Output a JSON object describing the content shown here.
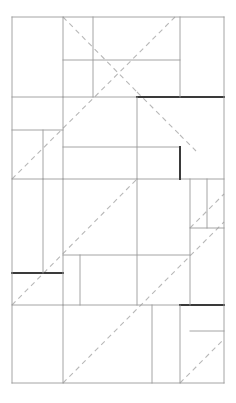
{
  "figure": {
    "canvas": {
      "width": 236,
      "height": 403,
      "background": "#ffffff"
    },
    "colors": {
      "line_light": "#9a9a9a",
      "line_dark": "#3a3a3a",
      "border": "#8d8d8d",
      "dashed": "#b8b8b8",
      "background": "#ffffff"
    },
    "stroke_widths": {
      "thin": 0.9,
      "thick": 1.6,
      "dashed": 1.1
    },
    "dash_pattern": "5,4",
    "outer_rect": {
      "x": 12,
      "y": 17,
      "width": 212,
      "height": 366
    },
    "partition_lines": [
      {
        "name": "h-outer-top",
        "orientation": "horizontal",
        "y": 17,
        "x1": 12,
        "x2": 224,
        "weight": "thin"
      },
      {
        "name": "h-band-1",
        "orientation": "horizontal",
        "y": 60,
        "x1": 63,
        "x2": 180,
        "weight": "thin"
      },
      {
        "name": "h-band-2-left",
        "orientation": "horizontal",
        "y": 97,
        "x1": 12,
        "x2": 137,
        "weight": "thin"
      },
      {
        "name": "h-band-2-right",
        "orientation": "horizontal",
        "y": 97,
        "x1": 137,
        "x2": 224,
        "weight": "thick"
      },
      {
        "name": "h-band-3",
        "orientation": "horizontal",
        "y": 130,
        "x1": 12,
        "x2": 63,
        "weight": "thin"
      },
      {
        "name": "h-band-4",
        "orientation": "horizontal",
        "y": 147,
        "x1": 63,
        "x2": 180,
        "weight": "thin"
      },
      {
        "name": "h-band-5",
        "orientation": "horizontal",
        "y": 179,
        "x1": 12,
        "x2": 224,
        "weight": "thin"
      },
      {
        "name": "h-band-6",
        "orientation": "horizontal",
        "y": 228,
        "x1": 190,
        "x2": 224,
        "weight": "thin"
      },
      {
        "name": "h-band-7",
        "orientation": "horizontal",
        "y": 255,
        "x1": 63,
        "x2": 190,
        "weight": "thin"
      },
      {
        "name": "h-band-8",
        "orientation": "horizontal",
        "y": 273,
        "x1": 12,
        "x2": 63,
        "weight": "thick"
      },
      {
        "name": "h-band-9",
        "orientation": "horizontal",
        "y": 305,
        "x1": 12,
        "x2": 180,
        "weight": "thin"
      },
      {
        "name": "h-band-9b",
        "orientation": "horizontal",
        "y": 305,
        "x1": 180,
        "x2": 224,
        "weight": "thick"
      },
      {
        "name": "h-band-10",
        "orientation": "horizontal",
        "y": 331,
        "x1": 190,
        "x2": 224,
        "weight": "thin"
      },
      {
        "name": "h-outer-bottom",
        "orientation": "horizontal",
        "y": 383,
        "x1": 12,
        "x2": 224,
        "weight": "thin"
      },
      {
        "name": "v-outer-left",
        "orientation": "vertical",
        "x": 12,
        "y1": 17,
        "y2": 383,
        "weight": "thin"
      },
      {
        "name": "v-col-a-top",
        "orientation": "vertical",
        "x": 63,
        "y1": 17,
        "y2": 97,
        "weight": "thin"
      },
      {
        "name": "v-col-b-top",
        "orientation": "vertical",
        "x": 93,
        "y1": 17,
        "y2": 97,
        "weight": "thin"
      },
      {
        "name": "v-col-c-top",
        "orientation": "vertical",
        "x": 180,
        "y1": 17,
        "y2": 97,
        "weight": "thin"
      },
      {
        "name": "v-col-mid-1",
        "orientation": "vertical",
        "x": 63,
        "y1": 97,
        "y2": 179,
        "weight": "thin"
      },
      {
        "name": "v-col-mid-2",
        "orientation": "vertical",
        "x": 137,
        "y1": 97,
        "y2": 179,
        "weight": "thin"
      },
      {
        "name": "v-col-mid-3",
        "orientation": "vertical",
        "x": 43,
        "y1": 130,
        "y2": 179,
        "weight": "thin"
      },
      {
        "name": "v-col-mid-dark",
        "orientation": "vertical",
        "x": 180,
        "y1": 147,
        "y2": 179,
        "weight": "thick"
      },
      {
        "name": "v-col-low-1",
        "orientation": "vertical",
        "x": 43,
        "y1": 179,
        "y2": 273,
        "weight": "thin"
      },
      {
        "name": "v-col-low-2",
        "orientation": "vertical",
        "x": 63,
        "y1": 179,
        "y2": 305,
        "weight": "thin"
      },
      {
        "name": "v-col-low-3",
        "orientation": "vertical",
        "x": 137,
        "y1": 179,
        "y2": 305,
        "weight": "thin"
      },
      {
        "name": "v-col-low-4",
        "orientation": "vertical",
        "x": 190,
        "y1": 179,
        "y2": 305,
        "weight": "thin"
      },
      {
        "name": "v-col-low-5",
        "orientation": "vertical",
        "x": 207,
        "y1": 179,
        "y2": 228,
        "weight": "thin"
      },
      {
        "name": "v-col-low-6",
        "orientation": "vertical",
        "x": 80,
        "y1": 255,
        "y2": 305,
        "weight": "thin"
      },
      {
        "name": "v-col-bot-1",
        "orientation": "vertical",
        "x": 63,
        "y1": 305,
        "y2": 383,
        "weight": "thin"
      },
      {
        "name": "v-col-bot-2",
        "orientation": "vertical",
        "x": 152,
        "y1": 305,
        "y2": 383,
        "weight": "thin"
      },
      {
        "name": "v-col-bot-3",
        "orientation": "vertical",
        "x": 180,
        "y1": 305,
        "y2": 383,
        "weight": "thin"
      },
      {
        "name": "v-outer-right",
        "orientation": "vertical",
        "x": 224,
        "y1": 17,
        "y2": 383,
        "weight": "thin"
      }
    ],
    "diagonals": [
      {
        "name": "diag-descending-1",
        "direction": "down-right",
        "x1": 63,
        "y1": 17,
        "x2": 137,
        "y2": 92
      },
      {
        "name": "diag-descending-2",
        "direction": "down-right",
        "x1": 137,
        "y1": 92,
        "x2": 180,
        "y2": 135
      },
      {
        "name": "diag-descending-3",
        "direction": "down-right",
        "x1": 180,
        "y1": 135,
        "x2": 196,
        "y2": 151
      },
      {
        "name": "diag-ascending-1",
        "direction": "up-right",
        "x1": 12,
        "y1": 179,
        "x2": 175,
        "y2": 17
      },
      {
        "name": "diag-ascending-2",
        "direction": "up-right",
        "x1": 12,
        "y1": 305,
        "x2": 137,
        "y2": 179
      },
      {
        "name": "diag-ascending-3",
        "direction": "up-right",
        "x1": 63,
        "y1": 383,
        "x2": 224,
        "y2": 222
      },
      {
        "name": "diag-ascending-4",
        "direction": "up-right",
        "x1": 180,
        "y1": 383,
        "x2": 224,
        "y2": 339
      },
      {
        "name": "diag-ascending-5",
        "direction": "up-right",
        "x1": 190,
        "y1": 228,
        "x2": 224,
        "y2": 194
      }
    ]
  }
}
